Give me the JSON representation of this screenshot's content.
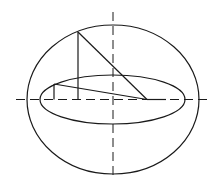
{
  "diagram": {
    "type": "geometric-construction",
    "stroke_color": "#1a1a1a",
    "background": "#ffffff",
    "outer_ellipse": {
      "cx": 113,
      "cy": 99.5,
      "rx": 86,
      "ry": 74.5
    },
    "inner_ellipse": {
      "cx": 112.5,
      "cy": 99.5,
      "rx": 72.5,
      "ry": 24.5
    },
    "axes": {
      "horizontal": {
        "x1": 16,
        "y1": 99.5,
        "x2": 207,
        "y2": 99.5
      },
      "vertical": {
        "x1": 113,
        "y1": 12,
        "x2": 113,
        "y2": 178
      }
    },
    "lines": [
      {
        "id": "outer-vertical",
        "x1": 78,
        "y1": 32,
        "x2": 78,
        "y2": 99.5
      },
      {
        "id": "outer-diagonal",
        "x1": 78,
        "y1": 32,
        "x2": 147,
        "y2": 99.5
      },
      {
        "id": "inner-vertical",
        "x1": 54,
        "y1": 84,
        "x2": 54,
        "y2": 99.5
      },
      {
        "id": "inner-diagonal",
        "x1": 54,
        "y1": 84,
        "x2": 147,
        "y2": 99.5
      },
      {
        "id": "base-segment",
        "x1": 147,
        "y1": 99.5,
        "x2": 166,
        "y2": 99.5
      }
    ]
  }
}
